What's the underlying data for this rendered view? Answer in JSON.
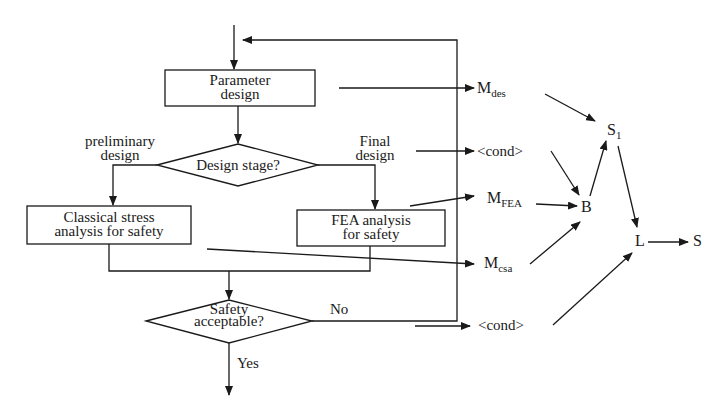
{
  "flowchart": {
    "parameter_box": {
      "line1": "Parameter",
      "line2": "design"
    },
    "design_stage": {
      "label": "Design stage?"
    },
    "branch_left": {
      "line1": "preliminary",
      "line2": "design"
    },
    "branch_right": {
      "line1": "Final",
      "line2": "design"
    },
    "classical_box": {
      "line1": "Classical stress",
      "line2": "analysis for safety"
    },
    "fea_box": {
      "line1": "FEA analysis",
      "line2": "for safety"
    },
    "safety_decision": {
      "line1": "Safety",
      "line2": "acceptable?"
    },
    "no_label": "No",
    "yes_label": "Yes"
  },
  "network": {
    "m_des": {
      "base": "M",
      "sub": "des"
    },
    "cond_top": "<cond>",
    "m_fea": {
      "base": "M",
      "sub": "FEA"
    },
    "m_csa": {
      "base": "M",
      "sub": "csa"
    },
    "cond_bottom": "<cond>",
    "node_b": "B",
    "node_s1": {
      "base": "S",
      "sub": "1"
    },
    "node_l": "L",
    "node_s": "S"
  },
  "colors": {
    "stroke": "#1a1a1a",
    "background": "#ffffff"
  }
}
